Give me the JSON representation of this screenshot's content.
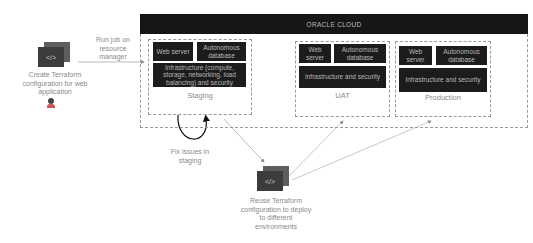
{
  "cloud": {
    "title": "ORACLE CLOUD"
  },
  "left_step": {
    "label": "Create Terraform configuration for web application",
    "icon": "terraform-code-icon",
    "user_icon": "user-icon"
  },
  "run_job": {
    "label": "Run job on resource manager"
  },
  "environments": [
    {
      "name": "Staging",
      "blocks": [
        "Web server",
        "Autonomous database",
        "Infrastructure (compute, storage, networking, load balancing) and security"
      ]
    },
    {
      "name": "UAT",
      "blocks": [
        "Web server",
        "Autonomous database",
        "Infrastructure and security"
      ]
    },
    {
      "name": "Production",
      "blocks": [
        "Web server",
        "Autonomous database",
        "Infrastructure and security"
      ]
    }
  ],
  "fix_issues": {
    "label": "Fix issues in staging"
  },
  "reuse_step": {
    "label": "Reuse Terraform configuration to deploy to different environments",
    "icon": "terraform-code-icon"
  },
  "colors": {
    "block_bg": "#1c1c1c",
    "block_text": "#b8b8b8",
    "dashed_border": "#9a9a9a",
    "caption_text": "#8a8a8a"
  }
}
